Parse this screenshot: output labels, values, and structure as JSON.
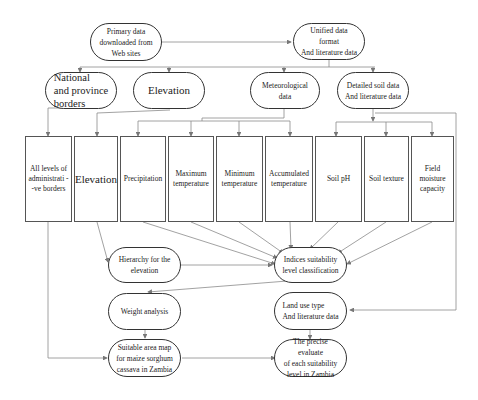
{
  "diagram": {
    "title": "",
    "level1": {
      "primary": "Primary data\ndownloaded  from\nWeb sites",
      "unified": "Unified data format\nAnd literature data"
    },
    "level2": {
      "borders": "National\nand province\nborders",
      "elevation": "Elevation",
      "meteorological": "Meteorological data",
      "soil": "Detailed soil data\nAnd literature data"
    },
    "level3": [
      "All levels of\nadministrati -\n-ve borders",
      "Elevation",
      "Precipitation",
      "Maximum\ntemperature",
      "Minimum\ntemperature",
      "Accumulated\ntemperature",
      "Soil pH",
      "Soil texture",
      "Field\nmoisture\ncapacity"
    ],
    "process": {
      "hierarchy": "Hierarchy for the\nelevation",
      "indices": "Indices suitability\nlevel classification",
      "weight": "Weight analysis",
      "landuse": "Land use type\nAnd    literature data",
      "suitable_map": "Suitable area map\nfor maize sorghum\ncassava in Zambia",
      "precise": "The precise evaluate\nof each suitability\nlevel in Zambia"
    },
    "colors": {
      "line": "#888888",
      "border": "#333333"
    }
  }
}
